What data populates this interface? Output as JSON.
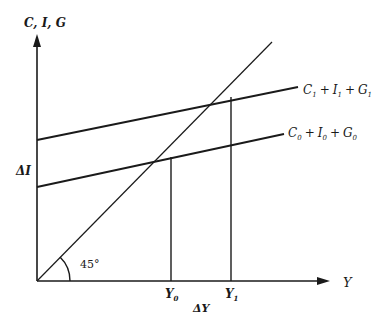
{
  "diagram": {
    "type": "keynesian-cross",
    "axes": {
      "y_label": "C, I, G",
      "x_label": "Υ"
    },
    "lines": {
      "upper": {
        "label_C": "C",
        "label_I": "I",
        "label_G": "G",
        "sub": "1",
        "plus": "+"
      },
      "lower": {
        "label_C": "C",
        "label_I": "I",
        "label_G": "G",
        "sub": "0",
        "plus": "+"
      },
      "diagonal": {
        "angle_label": "45°"
      }
    },
    "annotations": {
      "delta_I": "ΔI",
      "delta_Y": "ΔΥ",
      "y0": "Υ",
      "y0_sub": "0",
      "y1": "Υ",
      "y1_sub": "1"
    },
    "colors": {
      "line": "#1a1a1a",
      "background": "#ffffff"
    }
  }
}
